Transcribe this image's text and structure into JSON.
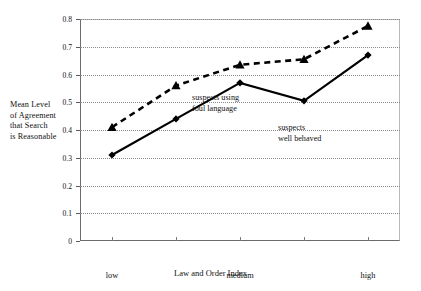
{
  "chart_data": {
    "type": "line",
    "title": "",
    "xlabel": "Law and Order Index",
    "ylabel": "Mean Level of Agreement that Search is Reasonable",
    "ylabel_lines": [
      "Mean Level",
      "of Agreement",
      "that Search",
      "is Reasonable"
    ],
    "x": [
      1,
      2,
      3,
      4,
      5
    ],
    "categories": [
      "low",
      "",
      "medium",
      "",
      "high"
    ],
    "xtick_labels": [
      "low",
      "medium",
      "high"
    ],
    "ytick_labels": [
      "0",
      "0.1",
      "0.2",
      "0.3",
      "0.4",
      "0.5",
      "0.6",
      "0.7",
      "0.8"
    ],
    "ytick_values": [
      0,
      0.1,
      0.2,
      0.3,
      0.4,
      0.5,
      0.6,
      0.7,
      0.8
    ],
    "ylim": [
      0,
      0.8
    ],
    "xlim": [
      0.5,
      5.5
    ],
    "grid": "horizontal-dotted",
    "legend": "inline-annotations",
    "series": [
      {
        "name": "suspects using foul language",
        "label_lines": [
          "suspects using",
          "foul language"
        ],
        "marker": "triangle",
        "line_style": "dashed",
        "color": "#000000",
        "values": [
          0.41,
          0.56,
          0.635,
          0.655,
          0.775
        ]
      },
      {
        "name": "suspects well behaved",
        "label_lines": [
          "suspects",
          "well behaved"
        ],
        "marker": "diamond",
        "line_style": "solid",
        "color": "#000000",
        "values": [
          0.31,
          0.44,
          0.57,
          0.505,
          0.67
        ]
      }
    ]
  }
}
